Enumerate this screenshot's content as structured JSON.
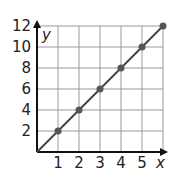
{
  "chart_data": {
    "type": "line",
    "title": "",
    "xlabel": "x",
    "ylabel": "y",
    "x": [
      0,
      1,
      2,
      3,
      4,
      5,
      6
    ],
    "series": [
      {
        "name": "y = 2x",
        "values": [
          0,
          2,
          4,
          6,
          8,
          10,
          12
        ],
        "markers_at_x": [
          1,
          2,
          3,
          4,
          5,
          6
        ]
      }
    ],
    "x_ticks": [
      "1",
      "2",
      "3",
      "4",
      "5"
    ],
    "y_ticks": [
      "2",
      "4",
      "6",
      "8",
      "10",
      "12"
    ],
    "xlim": [
      0,
      6
    ],
    "ylim": [
      0,
      12
    ],
    "grid": true,
    "legend": "none",
    "colors": {
      "line": "#444444",
      "marker": "#555555",
      "grid": "#999999",
      "axis": "#111111"
    }
  }
}
